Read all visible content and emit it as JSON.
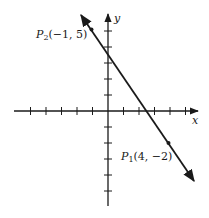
{
  "diagram": {
    "type": "coordinate-plane-line",
    "axes": {
      "x_label": "x",
      "y_label": "y",
      "x_ticks": [
        -5,
        -4,
        -3,
        -2,
        -1,
        1,
        2,
        3,
        4,
        5
      ],
      "y_ticks": [
        -5,
        -4,
        -3,
        -2,
        -1,
        1,
        2,
        3,
        4,
        5
      ],
      "x_range": [
        -6,
        6
      ],
      "y_range": [
        -6,
        6
      ]
    },
    "line": {
      "description": "line through P1 and P2 with arrows at both ends",
      "slope": -1.4,
      "color": "#1a1a1a"
    },
    "points": [
      {
        "name": "P2",
        "label_main": "P",
        "label_sub": "2",
        "label_coords": "(−1, 5)",
        "x": -1,
        "y": 5
      },
      {
        "name": "P1",
        "label_main": "P",
        "label_sub": "1",
        "label_coords": "(4, −2)",
        "x": 4,
        "y": -2
      }
    ]
  }
}
